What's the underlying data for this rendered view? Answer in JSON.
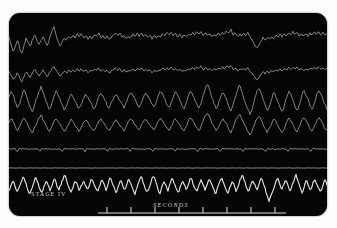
{
  "figure": {
    "kind": "polysomnogram-recording",
    "background_color": "#fdfdfd",
    "panel_color": "#050505",
    "trace_color": "#b9b9ae",
    "bright_trace_color": "#e8e8df",
    "scale_color": "#dedad0"
  },
  "labels": {
    "stage": "STAGE  IV",
    "time_axis": "SECONDS"
  },
  "time_scale": {
    "tick_count": 8,
    "start_x": 98,
    "end_x": 268,
    "spacing_px": 24,
    "baseline_y": 200,
    "tick_height": 6
  },
  "chart_data": {
    "type": "line",
    "title": "STAGE  IV",
    "xlabel": "SECONDS",
    "ylabel": "",
    "grid": false,
    "legend": "none",
    "xlim": [
      0,
      318
    ],
    "ylim": [
      0,
      203
    ],
    "channels": [
      {
        "name": "eeg-channel-1",
        "baseline_y": 30,
        "amplitude": 14,
        "brightness": "dim",
        "values": [
          6,
          -2,
          -9,
          -4,
          4,
          -6,
          -12,
          -3,
          5,
          1,
          -4,
          4,
          10,
          4,
          -2,
          3,
          7,
          2,
          -3,
          5,
          13,
          20,
          9,
          1,
          -3,
          2,
          6,
          3,
          8,
          5,
          9,
          6,
          10,
          7,
          11,
          6,
          9,
          4,
          8,
          5,
          10,
          7,
          12,
          6,
          9,
          5,
          8,
          4,
          7,
          9,
          12,
          8,
          11,
          6,
          9,
          5,
          8,
          6,
          10,
          7,
          11,
          8,
          12,
          7,
          10,
          6,
          9,
          5,
          8,
          6,
          9,
          7,
          11,
          8,
          12,
          9,
          13,
          8,
          11,
          7,
          10,
          6,
          9,
          7,
          10,
          8,
          12,
          9,
          13,
          10,
          14,
          9,
          12,
          8,
          11,
          7,
          10,
          8,
          11,
          9,
          13,
          10,
          14,
          11,
          15,
          9,
          12,
          7,
          10,
          8,
          11,
          9,
          12,
          6,
          3,
          -2,
          -6,
          -3,
          2,
          6,
          3,
          7,
          4,
          8,
          5,
          9,
          6,
          10,
          7,
          11,
          8,
          12,
          9,
          13,
          10,
          12,
          8,
          11,
          7,
          10,
          8,
          11,
          9,
          12,
          10,
          13,
          9,
          12,
          8,
          11
        ]
      },
      {
        "name": "eeg-channel-2",
        "baseline_y": 60,
        "amplitude": 11,
        "brightness": "dim",
        "values": [
          2,
          -4,
          -10,
          -5,
          1,
          -7,
          -13,
          -5,
          2,
          -2,
          -7,
          0,
          5,
          1,
          -4,
          0,
          4,
          -1,
          -6,
          1,
          6,
          9,
          4,
          -1,
          -5,
          -1,
          3,
          0,
          4,
          1,
          5,
          2,
          6,
          3,
          7,
          2,
          5,
          1,
          4,
          2,
          6,
          3,
          8,
          2,
          5,
          1,
          4,
          0,
          3,
          5,
          8,
          4,
          7,
          2,
          5,
          1,
          4,
          2,
          6,
          3,
          7,
          4,
          8,
          3,
          6,
          2,
          5,
          1,
          4,
          2,
          5,
          3,
          7,
          4,
          8,
          5,
          9,
          4,
          7,
          3,
          6,
          2,
          5,
          3,
          6,
          4,
          8,
          5,
          9,
          6,
          10,
          5,
          8,
          4,
          7,
          3,
          6,
          4,
          7,
          5,
          9,
          6,
          10,
          7,
          11,
          5,
          8,
          3,
          6,
          4,
          7,
          5,
          8,
          2,
          -1,
          -6,
          -10,
          -7,
          -2,
          2,
          -1,
          3,
          0,
          4,
          1,
          5,
          2,
          6,
          3,
          7,
          4,
          8,
          5,
          9,
          6,
          8,
          4,
          7,
          3,
          6,
          4,
          7,
          5,
          8,
          6,
          9,
          5,
          8,
          4,
          7
        ]
      },
      {
        "name": "eeg-channel-3",
        "baseline_y": 88,
        "amplitude": 16,
        "brightness": "dim",
        "values": [
          4,
          10,
          6,
          -2,
          -8,
          -3,
          5,
          12,
          6,
          0,
          -6,
          -11,
          -4,
          3,
          9,
          14,
          8,
          2,
          -4,
          -9,
          -3,
          4,
          10,
          6,
          1,
          -5,
          -9,
          -4,
          2,
          8,
          5,
          0,
          -5,
          -8,
          -3,
          3,
          7,
          4,
          -1,
          -5,
          -8,
          -2,
          4,
          8,
          5,
          1,
          -4,
          -7,
          -2,
          3,
          7,
          4,
          0,
          -4,
          -7,
          -1,
          5,
          9,
          6,
          2,
          -3,
          -6,
          -1,
          4,
          8,
          5,
          1,
          -3,
          -6,
          -1,
          5,
          10,
          6,
          2,
          -3,
          -7,
          -2,
          4,
          9,
          5,
          1,
          -4,
          -7,
          -2,
          5,
          10,
          7,
          2,
          -3,
          -7,
          -2,
          6,
          12,
          18,
          12,
          4,
          -2,
          -8,
          -4,
          3,
          9,
          6,
          1,
          -5,
          -10,
          -4,
          4,
          11,
          17,
          10,
          3,
          -3,
          -9,
          -14,
          -7,
          1,
          8,
          14,
          8,
          2,
          -4,
          -10,
          -5,
          2,
          9,
          5,
          0,
          -6,
          -11,
          -5,
          3,
          10,
          6,
          1,
          -5,
          -10,
          -4,
          4,
          11,
          7,
          2,
          -4,
          -9,
          -3,
          5,
          11,
          7,
          2,
          -4,
          -8
        ]
      },
      {
        "name": "eeg-channel-4",
        "baseline_y": 112,
        "amplitude": 13,
        "brightness": "dim",
        "values": [
          3,
          8,
          4,
          -2,
          -7,
          -2,
          4,
          9,
          5,
          -1,
          -6,
          -10,
          -3,
          3,
          8,
          12,
          6,
          1,
          -4,
          -8,
          -2,
          4,
          8,
          5,
          0,
          -5,
          -8,
          -3,
          2,
          7,
          4,
          -1,
          -5,
          -8,
          -2,
          3,
          6,
          3,
          -2,
          -5,
          -8,
          -2,
          4,
          7,
          4,
          0,
          -4,
          -7,
          -2,
          3,
          6,
          3,
          -1,
          -4,
          -7,
          -1,
          4,
          8,
          5,
          1,
          -3,
          -6,
          -1,
          4,
          7,
          4,
          0,
          -3,
          -6,
          -1,
          5,
          9,
          5,
          1,
          -3,
          -7,
          -2,
          4,
          8,
          4,
          0,
          -4,
          -7,
          -2,
          5,
          9,
          6,
          1,
          -3,
          -7,
          -2,
          6,
          11,
          15,
          10,
          3,
          -2,
          -7,
          -3,
          3,
          8,
          5,
          1,
          -5,
          -9,
          -4,
          4,
          10,
          14,
          8,
          2,
          -3,
          -8,
          -12,
          -6,
          1,
          7,
          12,
          7,
          1,
          -4,
          -9,
          -4,
          2,
          8,
          4,
          0,
          -5,
          -10,
          -4,
          3,
          9,
          5,
          1,
          -5,
          -9,
          -3,
          4,
          10,
          6,
          2,
          -4,
          -8,
          -3,
          4,
          10,
          6,
          2,
          -4,
          -7
        ]
      },
      {
        "name": "ekg-channel",
        "baseline_y": 136,
        "amplitude": 7,
        "brightness": "dim",
        "spike_interval": 11,
        "values": [
          0,
          0,
          0,
          1,
          -6,
          2,
          0,
          0,
          0,
          0,
          0,
          0,
          0,
          0,
          1,
          -6,
          2,
          0,
          0,
          0,
          0,
          0,
          0,
          0,
          0,
          1,
          -6,
          2,
          0,
          0,
          0,
          0,
          0,
          0,
          0,
          0,
          1,
          -6,
          2,
          0,
          0,
          0,
          0,
          0,
          0,
          0,
          0,
          1,
          -6,
          2,
          0,
          0,
          0,
          0,
          0,
          0,
          0,
          0,
          1,
          -6,
          2,
          0,
          0,
          0,
          0,
          0,
          0,
          0,
          0,
          1,
          -6,
          2,
          0,
          0,
          0,
          0,
          0,
          0,
          0,
          0,
          1,
          -6,
          2,
          0,
          0,
          0,
          0,
          0,
          0,
          0,
          0,
          1,
          -6,
          2,
          0,
          0,
          0,
          0,
          0,
          0,
          0,
          0,
          1,
          -6,
          2,
          0,
          0,
          0,
          0,
          0,
          0,
          0,
          0,
          1,
          -6,
          2,
          0,
          0,
          0,
          0,
          0,
          0,
          0,
          0,
          1,
          -6,
          2,
          0,
          0,
          0,
          0,
          0,
          0,
          0,
          0,
          1,
          -6,
          2,
          0,
          0,
          0,
          0,
          0,
          0,
          0,
          0,
          1,
          -6,
          2,
          0,
          0,
          0,
          0,
          0,
          0,
          0
        ]
      },
      {
        "name": "respiration-channel",
        "baseline_y": 155,
        "amplitude": 2,
        "brightness": "dim",
        "values": [
          0,
          1,
          0,
          -1,
          0,
          1,
          0,
          0,
          -1,
          0,
          1,
          0,
          0,
          1,
          0,
          -1,
          0,
          1,
          0,
          0,
          -1,
          0,
          1,
          0,
          0,
          1,
          0,
          -1,
          0,
          1,
          0,
          0,
          -1,
          0,
          1,
          0,
          0,
          1,
          0,
          -1,
          0,
          1,
          0,
          0,
          -1,
          0,
          1,
          0,
          0,
          1,
          0,
          -1,
          0,
          1,
          0,
          0,
          -1,
          0,
          1,
          0,
          0,
          1,
          0,
          -1,
          0,
          1,
          0,
          0,
          -1,
          0,
          1,
          0,
          0,
          1,
          0,
          -1,
          0,
          1,
          0,
          0,
          -1,
          0,
          1,
          0,
          0,
          1,
          0,
          -1,
          0,
          1,
          0,
          0,
          -1,
          0,
          1,
          0,
          0,
          1,
          0,
          -1,
          0,
          1,
          0,
          0,
          -1,
          0,
          1,
          0,
          0,
          1,
          0,
          -1,
          0,
          1,
          0,
          0,
          -1,
          0,
          1,
          0,
          0,
          1,
          0,
          -1,
          0,
          1,
          0,
          0,
          -1,
          0,
          1,
          0,
          0,
          1,
          0,
          -1,
          0,
          1,
          0,
          0,
          -1,
          0,
          1,
          0,
          0,
          1,
          0,
          -1,
          0,
          1,
          0,
          0
        ]
      },
      {
        "name": "delta-wave-channel",
        "baseline_y": 176,
        "amplitude": 15,
        "brightness": "bright",
        "values": [
          -2,
          4,
          9,
          3,
          -3,
          2,
          8,
          14,
          7,
          0,
          -5,
          1,
          7,
          13,
          6,
          -1,
          -4,
          3,
          9,
          4,
          -2,
          5,
          11,
          5,
          -1,
          4,
          10,
          16,
          8,
          1,
          -4,
          2,
          8,
          5,
          -2,
          3,
          9,
          4,
          -1,
          5,
          11,
          6,
          0,
          -3,
          4,
          10,
          5,
          -1,
          6,
          12,
          7,
          1,
          -4,
          3,
          9,
          4,
          -2,
          5,
          11,
          6,
          0,
          -5,
          2,
          8,
          14,
          7,
          0,
          -4,
          3,
          9,
          15,
          8,
          1,
          -5,
          2,
          8,
          4,
          -2,
          6,
          12,
          6,
          0,
          -4,
          3,
          9,
          5,
          -1,
          6,
          13,
          7,
          1,
          -3,
          4,
          10,
          5,
          -1,
          5,
          11,
          6,
          0,
          -6,
          1,
          7,
          13,
          6,
          -1,
          -5,
          2,
          8,
          4,
          -3,
          4,
          10,
          16,
          9,
          2,
          -4,
          3,
          9,
          5,
          -1,
          5,
          12,
          7,
          1,
          -8,
          -13,
          -6,
          0,
          6,
          12,
          6,
          -1,
          4,
          10,
          5,
          -2,
          3,
          9,
          15,
          8,
          1,
          -4,
          3,
          9,
          4,
          -2,
          5,
          11,
          6,
          0,
          -3,
          4,
          10,
          5
        ]
      }
    ]
  }
}
